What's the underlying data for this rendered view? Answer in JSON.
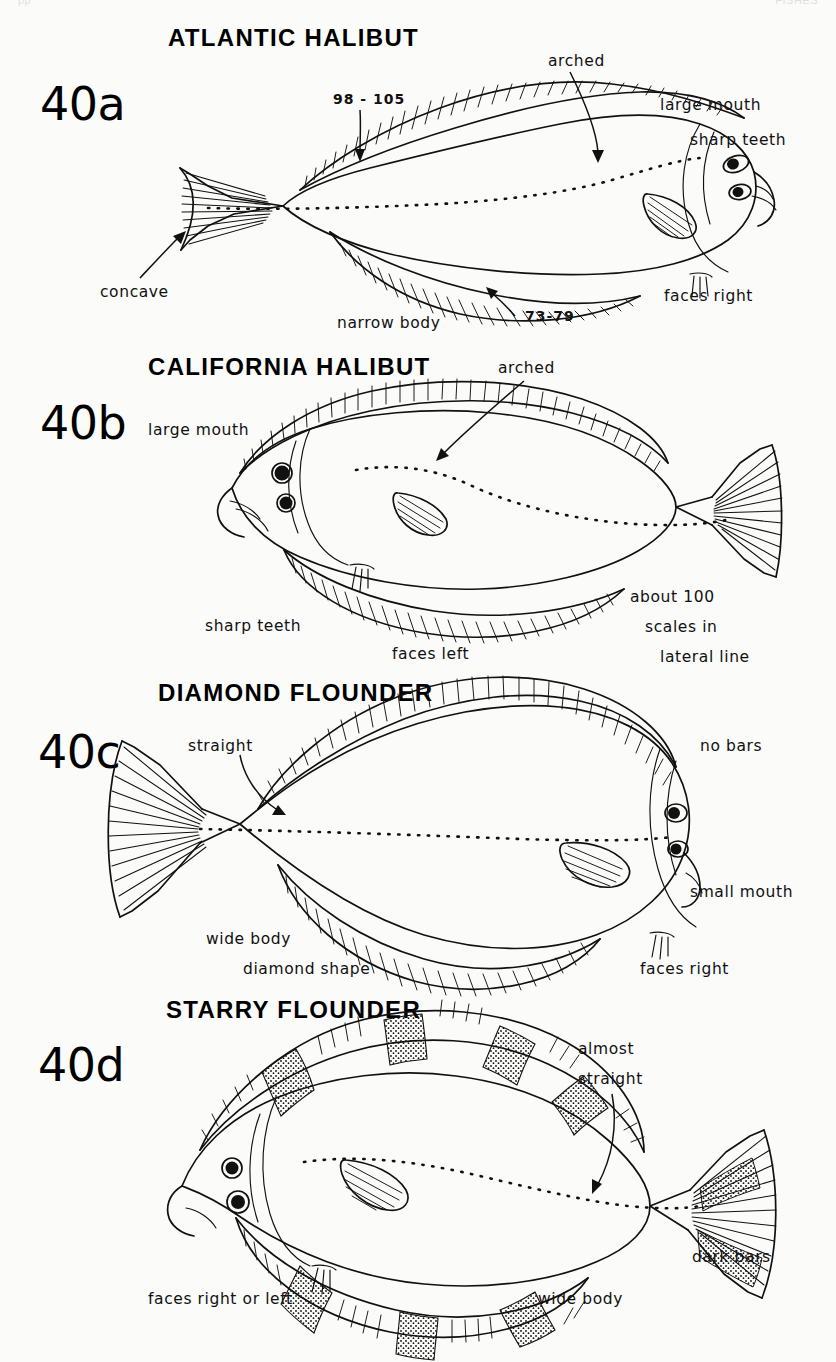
{
  "page": {
    "ghost_left": "pp",
    "ghost_right": "FISHES"
  },
  "panels": [
    {
      "id": "40a",
      "figure_number": "40a",
      "species_title": "ATLANTIC HALIBUT",
      "facing": "faces right",
      "labels": {
        "dorsal_count": "98 - 105",
        "anal_count": "73-79",
        "lateral_line": "arched",
        "mouth": "large mouth",
        "teeth": "sharp teeth",
        "tail": "concave",
        "body": "narrow body",
        "direction": "faces right"
      }
    },
    {
      "id": "40b",
      "figure_number": "40b",
      "species_title": "CALIFORNIA HALIBUT",
      "facing": "faces left",
      "labels": {
        "mouth": "large mouth",
        "lateral_line": "arched",
        "teeth": "sharp teeth",
        "direction": "faces left",
        "scales_1": "about 100",
        "scales_2": "scales in",
        "scales_3": "lateral line"
      }
    },
    {
      "id": "40c",
      "figure_number": "40c",
      "species_title": "DIAMOND FLOUNDER",
      "facing": "faces right",
      "labels": {
        "lateral_line": "straight",
        "bars": "no bars",
        "mouth": "small mouth",
        "body_1": "wide body",
        "body_2": "diamond shape",
        "direction": "faces right"
      }
    },
    {
      "id": "40d",
      "figure_number": "40d",
      "species_title": "STARRY FLOUNDER",
      "facing": "faces right or left",
      "labels": {
        "lateral_line_1": "almost",
        "lateral_line_2": "straight",
        "bars": "dark bars",
        "direction": "faces right or left",
        "body": "wide body"
      }
    }
  ],
  "colors": {
    "ink": "#111111",
    "paper": "#fbfbfa"
  }
}
